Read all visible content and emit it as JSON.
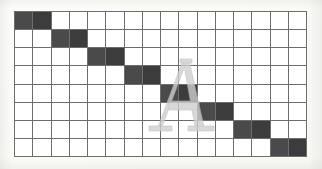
{
  "figure": {
    "type": "grid-diagram",
    "background_color": "#fcfcfa",
    "grid": {
      "columns": 16,
      "rows": 8,
      "line_color": "#6d6d6d",
      "empty_cell_color": "#ffffff",
      "filled_cell_color": "#4a4a4a",
      "filled_cell_alt_color": "#3c3c3c",
      "filled_cells": [
        {
          "row": 0,
          "cols": [
            0,
            1
          ]
        },
        {
          "row": 1,
          "cols": [
            2,
            3
          ]
        },
        {
          "row": 2,
          "cols": [
            4,
            5
          ]
        },
        {
          "row": 3,
          "cols": [
            6,
            7
          ]
        },
        {
          "row": 4,
          "cols": [
            8,
            9
          ]
        },
        {
          "row": 5,
          "cols": [
            10,
            11
          ]
        },
        {
          "row": 6,
          "cols": [
            12,
            13
          ]
        },
        {
          "row": 7,
          "cols": [
            14,
            15
          ]
        }
      ]
    },
    "watermark": {
      "glyph": "A",
      "style": "serif-capital",
      "color": "#cfcfcf",
      "outline_color": "#b8b8b8"
    }
  }
}
